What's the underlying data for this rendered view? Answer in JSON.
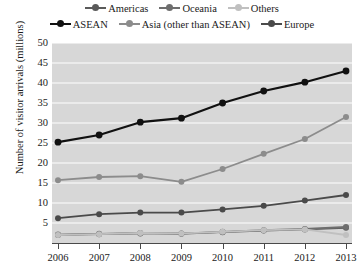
{
  "chart_data": {
    "type": "line",
    "title": "",
    "xlabel": "",
    "ylabel": "Number of visitor arrivals (millions)",
    "x": [
      2006,
      2007,
      2008,
      2009,
      2010,
      2011,
      2012,
      2013
    ],
    "xtick_labels": [
      "2006",
      "2007",
      "2008",
      "2009",
      "2010",
      "2011",
      "2012",
      "2013"
    ],
    "ylim": [
      0,
      50
    ],
    "yticks": [
      0,
      5,
      10,
      15,
      20,
      25,
      30,
      35,
      40,
      45,
      50
    ],
    "ytick_labels": [
      "",
      "5",
      "10",
      "15",
      "20",
      "25",
      "30",
      "35",
      "40",
      "45",
      "50"
    ],
    "grid": "horizontal",
    "legend_position": "top",
    "plot_background": "#d7d7d7",
    "gridline_color": "#ffffff",
    "series": [
      {
        "name": "Americas",
        "color": "#5a5a5a",
        "values": [
          2.0,
          2.2,
          2.4,
          2.4,
          2.7,
          3.1,
          3.4,
          3.8
        ]
      },
      {
        "name": "Oceania",
        "color": "#6e6e6e",
        "values": [
          2.1,
          2.3,
          2.5,
          2.3,
          2.8,
          3.2,
          3.5,
          4.0
        ]
      },
      {
        "name": "Others",
        "color": "#c0c0c0",
        "values": [
          2.0,
          2.2,
          2.5,
          2.4,
          2.8,
          3.2,
          3.4,
          2.0
        ]
      },
      {
        "name": "ASEAN",
        "color": "#111111",
        "values": [
          25.2,
          27.0,
          30.2,
          31.2,
          35.0,
          38.0,
          40.2,
          43.0
        ]
      },
      {
        "name": "Asia (other than ASEAN)",
        "color": "#8c8c8c",
        "values": [
          15.7,
          16.5,
          16.7,
          15.3,
          18.5,
          22.3,
          26.0,
          31.5
        ]
      },
      {
        "name": "Europe",
        "color": "#4a4a4a",
        "values": [
          6.2,
          7.2,
          7.6,
          7.6,
          8.4,
          9.3,
          10.6,
          12.0
        ]
      }
    ]
  },
  "legend": {
    "row1": [
      "Americas",
      "Oceania",
      "Others"
    ],
    "row2": [
      "ASEAN",
      "Asia (other than ASEAN)",
      "Europe"
    ]
  }
}
